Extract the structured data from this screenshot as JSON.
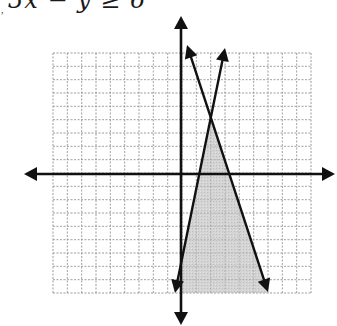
{
  "header": {
    "inequality_label": "3x − y ≥ 6",
    "leading_mark": ","
  },
  "chart_data": {
    "type": "line",
    "title": "3x − y ≥ 6",
    "xlabel": "",
    "ylabel": "",
    "grid": true,
    "xlim": [
      -9,
      9
    ],
    "ylim": [
      -9,
      9
    ],
    "axes": {
      "x_axis_arrows": true,
      "y_axis_arrows": true
    },
    "series": [
      {
        "name": "positive-slope boundary",
        "slope_sign": "positive",
        "x_intercept_approx": 1.4,
        "arrows_both_ends": true
      },
      {
        "name": "negative-slope boundary",
        "slope_sign": "negative",
        "x_intercept_approx": 3.5,
        "arrows_both_ends": true
      }
    ],
    "intersection_approx": {
      "x": 2.1,
      "y": 4.2
    },
    "shaded_region": "bounded by y-axis, both lines and bottom of grid (below intersection)",
    "colors": {
      "shade": "#c8c8c8",
      "grid": "#9a9a9a",
      "lines": "#111111"
    }
  },
  "geometry": {
    "grid": {
      "left": 53,
      "top": 53,
      "right": 311,
      "bottom": 293,
      "cols": 18,
      "rows": 18
    },
    "origin": {
      "x": 181,
      "y": 174
    },
    "x_axis": {
      "x1": 24,
      "x2": 335
    },
    "y_axis": {
      "y1": 16,
      "y2": 325
    },
    "line_a": {
      "x1": 225,
      "y1": 48,
      "x2": 175,
      "y2": 293
    },
    "line_b": {
      "x1": 187,
      "y1": 45,
      "x2": 268,
      "y2": 292
    },
    "shade_polygon": "211,118 181,264 181,293 268,293"
  }
}
